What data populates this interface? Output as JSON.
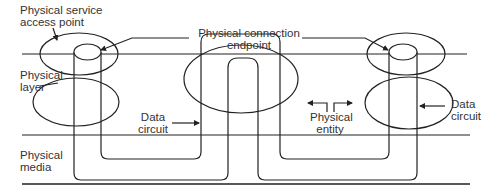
{
  "diagram": {
    "layers": {
      "physical_layer": "Physical layer",
      "physical_media": "Physical media"
    },
    "labels": {
      "service_access_point_1": "Physical service",
      "service_access_point_2": "access point",
      "connection_endpoint_1": "Physical connection",
      "connection_endpoint_2": "endpoint",
      "physical_layer_1": "Physical",
      "physical_layer_2": "layer",
      "data_circuit_left_1": "Data",
      "data_circuit_left_2": "circuit",
      "physical_entity_1": "Physical",
      "physical_entity_2": "entity",
      "data_circuit_right_1": "Data",
      "data_circuit_right_2": "circuit",
      "physical_media_1": "Physical",
      "physical_media_2": "media"
    },
    "colors": {
      "stroke": "#222222",
      "text": "#333333",
      "background": "#ffffff"
    }
  }
}
